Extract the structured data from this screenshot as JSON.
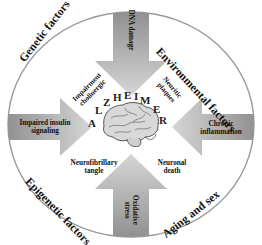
{
  "diagram": {
    "center_letters": [
      "A",
      "L",
      "Z",
      "H",
      "E",
      "I",
      "M",
      "E",
      "R"
    ],
    "outer_factors": {
      "top_left": "Genetic factors",
      "top_right": "Environmental factors",
      "bottom_left": "Epigenetic factors",
      "bottom_right": "Aging and sex"
    },
    "arrows": {
      "top": "DNA damage",
      "left": {
        "line1": "Impaired insulin",
        "line2": "signaling"
      },
      "right": {
        "line1": "Chronic",
        "line2": "inflammation"
      },
      "bottom": {
        "line1": "Oxidative",
        "line2": "stress"
      }
    },
    "inner_labels": {
      "top_left": {
        "line1": "Impairment",
        "line2": "cholinergic"
      },
      "top_right": {
        "line1": "Neuritic",
        "line2": "plaques"
      },
      "bottom_left": {
        "line1": "Neurofibrillary",
        "line2": "tangle"
      },
      "bottom_right": {
        "line1": "Neuronal",
        "line2": "death"
      }
    },
    "colors": {
      "ring_stroke": "#9a9a9a",
      "arrow_dark": "#8c8c8c",
      "arrow_light": "#d9d9d9",
      "text": "#111111"
    }
  }
}
